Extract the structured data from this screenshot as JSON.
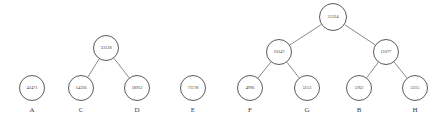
{
  "diagram": {
    "node_fill": "#ffffff",
    "node_stroke": "#5a5a5a",
    "edge_color": "#6b6b6b",
    "text_color": "#4a4a4a",
    "label_color": "#3a3a3a"
  },
  "trees": [
    {
      "id": "tree-a",
      "root": {
        "id": "node-a",
        "weight": "42471",
        "leaf_label": "A",
        "cx": 32,
        "cy": 88,
        "r": 13,
        "font_size": 5.2,
        "children": []
      }
    },
    {
      "id": "tree-cd",
      "root": {
        "id": "node-33138",
        "weight": "33138",
        "leaf_label": "",
        "cx": 106,
        "cy": 48,
        "r": 13,
        "font_size": 5.2,
        "children": [
          {
            "id": "node-c",
            "weight": "14226",
            "leaf_label": "C",
            "cx": 81,
            "cy": 88,
            "r": 13,
            "font_size": 5.2,
            "children": []
          },
          {
            "id": "node-d",
            "weight": "18912",
            "leaf_label": "D",
            "cx": 137,
            "cy": 88,
            "r": 13,
            "font_size": 5.2,
            "children": []
          }
        ]
      }
    },
    {
      "id": "tree-e",
      "root": {
        "id": "node-e",
        "weight": "71178",
        "leaf_label": "E",
        "cx": 193,
        "cy": 88,
        "r": 13,
        "font_size": 5.2,
        "children": []
      }
    },
    {
      "id": "tree-main",
      "root": {
        "id": "node-21224",
        "weight": "21224",
        "leaf_label": "",
        "cx": 333,
        "cy": 17,
        "r": 14,
        "font_size": 5.2,
        "children": [
          {
            "id": "node-10147",
            "weight": "10147",
            "leaf_label": "",
            "cx": 279,
            "cy": 52,
            "r": 13,
            "font_size": 5.2,
            "children": [
              {
                "id": "node-f",
                "weight": "4996",
                "leaf_label": "F",
                "cx": 250,
                "cy": 88,
                "r": 13,
                "font_size": 5.2,
                "children": []
              },
              {
                "id": "node-g",
                "weight": "5153",
                "leaf_label": "G",
                "cx": 307,
                "cy": 88,
                "r": 13,
                "font_size": 5.2,
                "children": []
              }
            ]
          },
          {
            "id": "node-11077",
            "weight": "11077",
            "leaf_label": "",
            "cx": 386,
            "cy": 52,
            "r": 13,
            "font_size": 5.2,
            "children": [
              {
                "id": "node-b",
                "weight": "5762",
                "leaf_label": "B",
                "cx": 359,
                "cy": 88,
                "r": 13,
                "font_size": 5.2,
                "children": []
              },
              {
                "id": "node-h",
                "weight": "5315",
                "leaf_label": "H",
                "cx": 415,
                "cy": 88,
                "r": 13,
                "font_size": 5.2,
                "children": []
              }
            ]
          }
        ]
      }
    }
  ],
  "leaf_labels": {
    "label_font_size": 7,
    "label_offset_y": 16,
    "items": [
      "A",
      "C",
      "D",
      "E",
      "F",
      "G",
      "B",
      "H"
    ]
  }
}
